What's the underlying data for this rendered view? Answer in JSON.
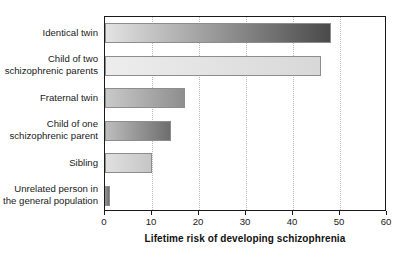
{
  "chart_data": {
    "type": "bar",
    "orientation": "horizontal",
    "title": "",
    "xlabel": "Lifetime risk of developing schizophrenia",
    "ylabel": "",
    "xlim": [
      0,
      60
    ],
    "xticks": [
      0,
      10,
      20,
      30,
      40,
      50,
      60
    ],
    "xtick_labels": [
      "0",
      "10",
      "20",
      "30",
      "40",
      "50",
      "60"
    ],
    "grid": true,
    "grid_axis": "x",
    "grid_style": "dotted",
    "legend": false,
    "categories": [
      "Identical twin",
      "Child of two\nschizophrenic parents",
      "Fraternal twin",
      "Child of one\nschizophrenic parent",
      "Sibling",
      "Unrelated person in\nthe general population"
    ],
    "values": [
      48,
      46,
      17,
      14,
      10,
      1
    ],
    "bar_colors_left": [
      "#e3e3e3",
      "#ededed",
      "#c9c9c9",
      "#bdbdbd",
      "#e0e0e0",
      "#8f8f8f"
    ],
    "bar_colors_right": [
      "#4a4a4a",
      "#d8d8d8",
      "#8e8e8e",
      "#6e6e6e",
      "#c6c6c6",
      "#6e6e6e"
    ],
    "frame_color": "#1a1a1a",
    "background": "#ffffff"
  }
}
